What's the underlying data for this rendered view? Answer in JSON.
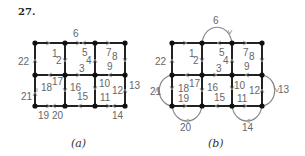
{
  "problem_number": "27.",
  "panels": [
    {
      "caption": "(a)",
      "labels": [
        {
          "t": "1",
          "x": 52,
          "y": 57
        },
        {
          "t": "2",
          "x": 56,
          "y": 64
        },
        {
          "t": "3",
          "x": 79,
          "y": 72
        },
        {
          "t": "4",
          "x": 86,
          "y": 64
        },
        {
          "t": "5",
          "x": 82,
          "y": 56
        },
        {
          "t": "6",
          "x": 73,
          "y": 37
        },
        {
          "t": "7",
          "x": 106,
          "y": 56
        },
        {
          "t": "8",
          "x": 112,
          "y": 60
        },
        {
          "t": "9",
          "x": 107,
          "y": 70
        },
        {
          "t": "10",
          "x": 99,
          "y": 87
        },
        {
          "t": "11",
          "x": 100,
          "y": 101
        },
        {
          "t": "12",
          "x": 112,
          "y": 94
        },
        {
          "t": "13",
          "x": 129,
          "y": 89
        },
        {
          "t": "14",
          "x": 112,
          "y": 119
        },
        {
          "t": "15",
          "x": 77,
          "y": 100
        },
        {
          "t": "16",
          "x": 70,
          "y": 91
        },
        {
          "t": "17",
          "x": 52,
          "y": 85
        },
        {
          "t": "18",
          "x": 41,
          "y": 91
        },
        {
          "t": "19",
          "x": 38,
          "y": 119
        },
        {
          "t": "20",
          "x": 52,
          "y": 119
        },
        {
          "t": "21",
          "x": 21,
          "y": 100
        },
        {
          "t": "22",
          "x": 18,
          "y": 65
        }
      ]
    },
    {
      "caption": "(b)",
      "labels": [
        {
          "t": "1",
          "x": 189,
          "y": 57
        },
        {
          "t": "2",
          "x": 193,
          "y": 64
        },
        {
          "t": "3",
          "x": 216,
          "y": 72
        },
        {
          "t": "4",
          "x": 223,
          "y": 64
        },
        {
          "t": "5",
          "x": 219,
          "y": 56
        },
        {
          "t": "6",
          "x": 213,
          "y": 24
        },
        {
          "t": "7",
          "x": 243,
          "y": 56
        },
        {
          "t": "8",
          "x": 249,
          "y": 60
        },
        {
          "t": "9",
          "x": 244,
          "y": 70
        },
        {
          "t": "10",
          "x": 234,
          "y": 89
        },
        {
          "t": "11",
          "x": 237,
          "y": 102
        },
        {
          "t": "12",
          "x": 249,
          "y": 94
        },
        {
          "t": "13",
          "x": 278,
          "y": 93
        },
        {
          "t": "14",
          "x": 242,
          "y": 131
        },
        {
          "t": "15",
          "x": 214,
          "y": 101
        },
        {
          "t": "16",
          "x": 207,
          "y": 91
        },
        {
          "t": "17",
          "x": 189,
          "y": 87
        },
        {
          "t": "18",
          "x": 178,
          "y": 92
        },
        {
          "t": "19",
          "x": 178,
          "y": 102
        },
        {
          "t": "20",
          "x": 180,
          "y": 131
        },
        {
          "t": "21",
          "x": 150,
          "y": 95
        },
        {
          "t": "22",
          "x": 155,
          "y": 65
        }
      ]
    }
  ]
}
